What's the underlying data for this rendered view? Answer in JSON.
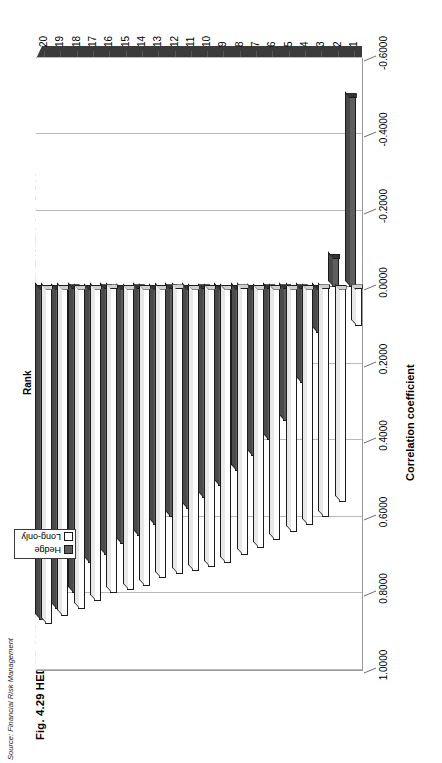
{
  "figure": {
    "title": "Fig. 4.29  HEDGE AND LONG-ONLY FUNDS – RANKED BY CORRELATION COEFFICIENT WITH S & P 500",
    "source": "Source: Financial Risk Management"
  },
  "legend": {
    "position": "top-center",
    "items": [
      {
        "label": "Hedge",
        "color": "#5e5e5e",
        "swatch": "hedge"
      },
      {
        "label": "Long-only",
        "color": "#ffffff",
        "swatch": "long"
      }
    ]
  },
  "chart_data": {
    "type": "bar",
    "orientation": "horizontal",
    "title": "Fig. 4.29  HEDGE AND LONG-ONLY FUNDS – RANKED BY CORRELATION COEFFICIENT WITH S & P 500",
    "xlabel": "Rank",
    "ylabel": "Correlation coefficient",
    "ylim": [
      -0.6,
      1.0
    ],
    "ytick_labels": [
      "1.0000",
      "0.8000",
      "0.6000",
      "0.4000",
      "0.2000",
      "0.0000",
      "-0.2000",
      "-0.4000",
      "-0.6000"
    ],
    "ytick_values": [
      1.0,
      0.8,
      0.6,
      0.4,
      0.2,
      0.0,
      -0.2,
      -0.4,
      -0.6
    ],
    "grid": true,
    "categories": [
      "1",
      "2",
      "3",
      "4",
      "5",
      "6",
      "7",
      "8",
      "9",
      "10",
      "11",
      "12",
      "13",
      "14",
      "15",
      "16",
      "17",
      "18",
      "19",
      "20"
    ],
    "series": [
      {
        "name": "Hedge",
        "color": "#5e5e5e",
        "values": [
          -0.5,
          -0.08,
          0.12,
          0.25,
          0.35,
          0.4,
          0.44,
          0.48,
          0.52,
          0.55,
          0.58,
          0.6,
          0.62,
          0.65,
          0.67,
          0.7,
          0.72,
          0.8,
          0.84,
          0.87
        ]
      },
      {
        "name": "Long-only",
        "color": "#ffffff",
        "values": [
          0.1,
          0.56,
          0.6,
          0.62,
          0.64,
          0.66,
          0.68,
          0.7,
          0.72,
          0.73,
          0.74,
          0.75,
          0.76,
          0.78,
          0.79,
          0.8,
          0.82,
          0.84,
          0.86,
          0.88
        ]
      }
    ]
  }
}
